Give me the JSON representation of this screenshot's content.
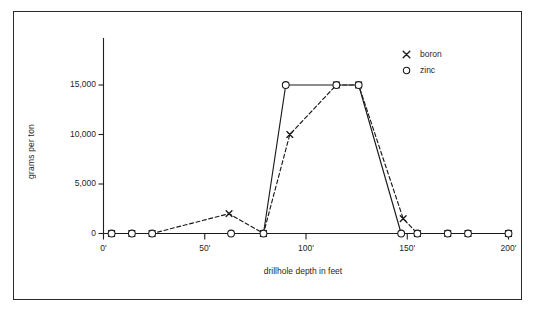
{
  "figure": {
    "border_color": "#2b2b2b",
    "background": "#ffffff"
  },
  "axis": {
    "y_title": "grams per ton",
    "x_title": "drillhole depth in feet",
    "y_ticks": [
      "0",
      "5,000",
      "10,000",
      "15,000"
    ],
    "x_ticks": [
      "0'",
      "50'",
      "100'",
      "150'",
      "200'"
    ]
  },
  "legend": {
    "items": [
      {
        "marker": "x-marker-icon",
        "label": "boron",
        "glyph": "x"
      },
      {
        "marker": "circle-marker-icon",
        "label": "zinc",
        "glyph": "o"
      }
    ]
  },
  "chart_data": {
    "type": "line",
    "title": "",
    "xlabel": "drillhole depth in feet",
    "ylabel": "grams per ton",
    "xlim": [
      0,
      200
    ],
    "ylim": [
      0,
      19000
    ],
    "yticks": [
      0,
      5000,
      10000,
      15000
    ],
    "ytick_labels": [
      "0",
      "5,000",
      "10,000",
      "15,000"
    ],
    "xticks": [
      0,
      50,
      100,
      150,
      200
    ],
    "xtick_labels": [
      "0'",
      "50'",
      "100'",
      "150'",
      "200'"
    ],
    "grid": false,
    "legend_position": "top-right",
    "series": [
      {
        "name": "boron",
        "marker": "x",
        "linestyle": "dashed",
        "color": "#1a1a1a",
        "points": [
          {
            "x": 4,
            "y": 0
          },
          {
            "x": 14,
            "y": 0
          },
          {
            "x": 24,
            "y": 0
          },
          {
            "x": 62,
            "y": 2000
          },
          {
            "x": 79,
            "y": 0
          },
          {
            "x": 92,
            "y": 10000
          },
          {
            "x": 115,
            "y": 15000
          },
          {
            "x": 126,
            "y": 15000
          },
          {
            "x": 148,
            "y": 1500
          },
          {
            "x": 155,
            "y": 0
          },
          {
            "x": 170,
            "y": 0
          },
          {
            "x": 180,
            "y": 0
          },
          {
            "x": 200,
            "y": 0
          }
        ]
      },
      {
        "name": "zinc",
        "marker": "o",
        "linestyle": "solid",
        "color": "#1a1a1a",
        "points": [
          {
            "x": 4,
            "y": 0
          },
          {
            "x": 14,
            "y": 0
          },
          {
            "x": 24,
            "y": 0
          },
          {
            "x": 63,
            "y": 0
          },
          {
            "x": 79,
            "y": 0
          },
          {
            "x": 90,
            "y": 15000
          },
          {
            "x": 115,
            "y": 15000
          },
          {
            "x": 126,
            "y": 15000
          },
          {
            "x": 147,
            "y": 0
          },
          {
            "x": 155,
            "y": 0
          },
          {
            "x": 170,
            "y": 0
          },
          {
            "x": 180,
            "y": 0
          },
          {
            "x": 200,
            "y": 0
          }
        ]
      }
    ]
  }
}
